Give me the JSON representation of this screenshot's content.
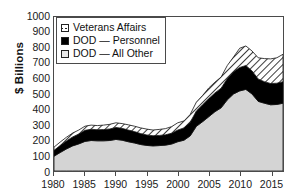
{
  "chart_data": {
    "type": "area",
    "title": "",
    "subtitle": "",
    "xlabel": "",
    "ylabel": "$ Billions",
    "stacked": true,
    "grid": false,
    "legend_position": "top-left",
    "xlim": [
      1980,
      2017
    ],
    "ylim": [
      0,
      1000
    ],
    "ytick_values": [
      0,
      100,
      200,
      300,
      400,
      500,
      600,
      700,
      800,
      900,
      1000
    ],
    "ytick_labels": [
      "0",
      "100",
      "200",
      "300",
      "400",
      "500",
      "600",
      "700",
      "800",
      "900",
      "1000"
    ],
    "xtick_values": [
      1980,
      1985,
      1990,
      1995,
      2000,
      2005,
      2010,
      2015
    ],
    "xtick_labels": [
      "1980",
      "1985",
      "1990",
      "1995",
      "2000",
      "2005",
      "2010",
      "2015"
    ],
    "x": [
      1980,
      1981,
      1982,
      1983,
      1984,
      1985,
      1986,
      1987,
      1988,
      1989,
      1990,
      1991,
      1992,
      1993,
      1994,
      1995,
      1996,
      1997,
      1998,
      1999,
      2000,
      2001,
      2002,
      2003,
      2004,
      2005,
      2006,
      2007,
      2008,
      2009,
      2010,
      2011,
      2012,
      2013,
      2014,
      2015,
      2016,
      2017
    ],
    "series": [
      {
        "name": "DOD — All Other",
        "key": "dod_all_other",
        "fill": "#d4d4d4",
        "pattern": "solid-gray",
        "stack_order": 1,
        "values": [
          96,
          120,
          143,
          163,
          176,
          192,
          198,
          196,
          196,
          198,
          205,
          200,
          190,
          182,
          172,
          166,
          163,
          165,
          168,
          175,
          190,
          200,
          228,
          290,
          320,
          352,
          385,
          410,
          462,
          500,
          520,
          530,
          500,
          452,
          440,
          430,
          432,
          440
        ]
      },
      {
        "name": "DOD — Personnel",
        "key": "dod_personnel",
        "fill": "#000000",
        "pattern": "solid-black",
        "stack_order": 2,
        "values": [
          38,
          45,
          52,
          58,
          64,
          72,
          73,
          72,
          73,
          75,
          78,
          77,
          76,
          74,
          71,
          68,
          66,
          66,
          67,
          70,
          76,
          80,
          88,
          100,
          110,
          118,
          122,
          128,
          138,
          145,
          152,
          155,
          150,
          145,
          140,
          138,
          138,
          140
        ]
      },
      {
        "name": "Veterans Affairs",
        "key": "veterans_affairs",
        "fill": "#ffffff",
        "pattern": "diagonal-hatch",
        "stack_order": 3,
        "values": [
          21,
          23,
          24,
          25,
          26,
          27,
          27,
          27,
          29,
          30,
          30,
          31,
          34,
          35,
          37,
          38,
          37,
          39,
          40,
          43,
          47,
          45,
          51,
          57,
          60,
          69,
          70,
          72,
          85,
          95,
          125,
          127,
          129,
          138,
          150,
          160,
          165,
          178
        ]
      }
    ],
    "totals": [
      155,
      188,
      219,
      246,
      266,
      291,
      298,
      295,
      298,
      303,
      313,
      308,
      300,
      291,
      280,
      272,
      266,
      270,
      275,
      288,
      313,
      325,
      367,
      447,
      490,
      539,
      577,
      610,
      685,
      740,
      797,
      812,
      779,
      735,
      730,
      728,
      735,
      758
    ]
  },
  "legend": {
    "items": [
      {
        "label": "Veterans Affairs",
        "swatch": "diagonal-hatch-swatch"
      },
      {
        "label": "DOD — Personnel",
        "swatch": "black-swatch"
      },
      {
        "label": "DOD — All Other",
        "swatch": "light-gray-swatch"
      }
    ]
  },
  "colors": {
    "dod_all_other": "#d4d4d4",
    "dod_personnel": "#000000",
    "veterans_affairs_fill": "#ffffff",
    "veterans_affairs_hatch": "#1a1a1a",
    "axis": "#4a4a4a",
    "text": "#1a1a1a",
    "background": "#ffffff"
  }
}
